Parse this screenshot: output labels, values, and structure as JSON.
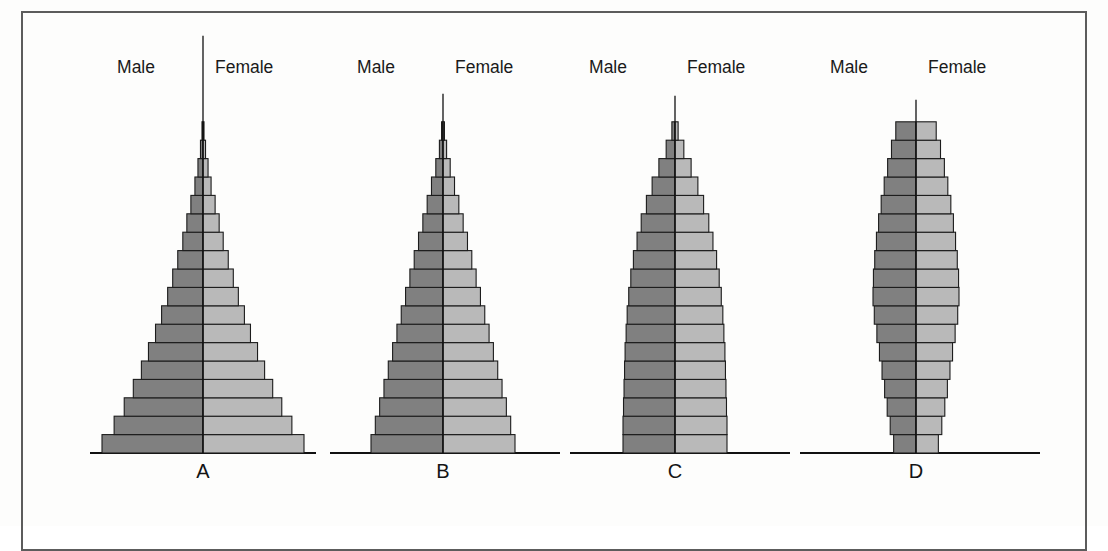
{
  "figure": {
    "background_color": "#fdfdfc",
    "border_color": "#5c5c5c",
    "male_color": "#808080",
    "female_color": "#b9b9b9",
    "outline_color": "#1c1c1c",
    "axis_color": "#111111"
  },
  "legend": {
    "male_label": "Male",
    "female_label": "Female"
  },
  "panels": [
    {
      "id": "A",
      "label": "A"
    },
    {
      "id": "B",
      "label": "B"
    },
    {
      "id": "C",
      "label": "C"
    },
    {
      "id": "D",
      "label": "D"
    }
  ],
  "chart_data": {
    "type": "bar",
    "title": "",
    "subtitle": "",
    "xlabel": "",
    "ylabel": "",
    "grid": false,
    "legend_position": "top",
    "orientation": "horizontal-back-to-back",
    "categories": [
      "0-4",
      "5-9",
      "10-14",
      "15-19",
      "20-24",
      "25-29",
      "30-34",
      "35-39",
      "40-44",
      "45-49",
      "50-54",
      "55-59",
      "60-64",
      "65-69",
      "70-74",
      "75-79",
      "80-84",
      "85+"
    ],
    "series": [
      {
        "name": "A",
        "shape": "expansive",
        "male": [
          100,
          88,
          78,
          69,
          61,
          54,
          47,
          41,
          35,
          30,
          25,
          20,
          16,
          12,
          8,
          5,
          2.5,
          1
        ],
        "female": [
          100,
          88,
          78,
          69,
          61,
          54,
          47,
          41,
          35,
          30,
          25,
          20,
          16,
          12,
          8,
          5,
          2.5,
          1
        ]
      },
      {
        "name": "B",
        "shape": "expansive-narrow",
        "male": [
          100,
          94,
          88,
          82,
          76,
          70,
          64,
          58,
          52,
          46,
          40,
          34,
          28,
          22,
          16,
          10,
          5,
          2
        ],
        "female": [
          100,
          94,
          88,
          82,
          76,
          70,
          64,
          58,
          52,
          46,
          40,
          34,
          28,
          22,
          16,
          10,
          5,
          2
        ]
      },
      {
        "name": "C",
        "shape": "stationary",
        "male": [
          100,
          100,
          99,
          98,
          97,
          96,
          94,
          92,
          89,
          85,
          80,
          73,
          65,
          55,
          44,
          31,
          17,
          6
        ],
        "female": [
          100,
          100,
          99,
          98,
          97,
          96,
          94,
          92,
          89,
          85,
          80,
          73,
          65,
          55,
          44,
          31,
          17,
          6
        ]
      },
      {
        "name": "D",
        "shape": "contractive",
        "male": [
          52,
          60,
          67,
          73,
          79,
          85,
          91,
          97,
          100,
          99,
          96,
          92,
          87,
          81,
          74,
          66,
          57,
          47
        ],
        "female": [
          52,
          60,
          67,
          73,
          79,
          85,
          91,
          97,
          100,
          99,
          96,
          92,
          87,
          81,
          74,
          66,
          57,
          47
        ]
      }
    ],
    "max_value": 100,
    "units": "relative population (unlabelled axis)"
  }
}
